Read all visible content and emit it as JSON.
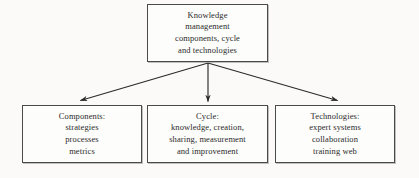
{
  "diagram": {
    "type": "hierarchy-tree",
    "orientation": "top-down",
    "background_color": "#fbfaf8",
    "line_color": "#2b2b2b",
    "box_border_color": "#4a4a4a",
    "text_color": "#2b2b2b",
    "root": {
      "id": "root",
      "label": "Knowledge\nmanagement\ncomponents, cycle\nand technologies",
      "lines": [
        "Knowledge",
        "management",
        "components, cycle",
        "and technologies"
      ]
    },
    "children": [
      {
        "id": "components",
        "label": "Components:\nstrategies\nprocesses\nmetrics",
        "heading": "Components:",
        "lines": [
          "Components:",
          "strategies",
          "processes",
          "metrics"
        ]
      },
      {
        "id": "cycle",
        "label": "Cycle:\nknowledge, creation,\nsharing, measurement\nand improvement",
        "heading": "Cycle:",
        "lines": [
          "Cycle:",
          "knowledge, creation,",
          "sharing, measurement",
          "and improvement"
        ]
      },
      {
        "id": "technologies",
        "label": "Technologies:\nexpert systems\ncollaboration\ntraining web",
        "heading": "Technologies:",
        "lines": [
          "Technologies:",
          "expert systems",
          "collaboration",
          "training web"
        ]
      }
    ],
    "connectors": [
      {
        "id": "root-to-components",
        "from": "root",
        "to": "components",
        "style": "arrow"
      },
      {
        "id": "root-to-cycle",
        "from": "root",
        "to": "cycle",
        "style": "arrow"
      },
      {
        "id": "root-to-technologies",
        "from": "root",
        "to": "technologies",
        "style": "arrow"
      }
    ]
  }
}
